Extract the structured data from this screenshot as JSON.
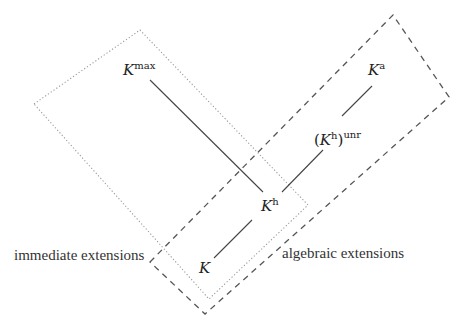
{
  "diagram": {
    "type": "field-extension-lattice",
    "nodes": {
      "K": {
        "base": "K",
        "sup": ""
      },
      "Kh": {
        "base": "K",
        "sup": "h"
      },
      "Kmax": {
        "base": "K",
        "sup": "max"
      },
      "Ka": {
        "base": "K",
        "sup": "a"
      },
      "Khunr": {
        "open": "(",
        "base": "K",
        "sup": "h",
        "close": ")",
        "outer_sup": "unr"
      }
    },
    "edges": [
      {
        "from": "K",
        "to": "Kh"
      },
      {
        "from": "Kh",
        "to": "Kmax"
      },
      {
        "from": "Kh",
        "to": "Khunr"
      },
      {
        "from": "Khunr",
        "to": "Ka"
      }
    ],
    "regions": [
      {
        "name": "immediate-extensions",
        "label": "immediate extensions",
        "style": "dotted"
      },
      {
        "name": "algebraic-extensions",
        "label": "algebraic extensions",
        "style": "dashed"
      }
    ],
    "colors": {
      "stroke": "#555555",
      "text": "#222222",
      "dotted": "#9a9a9a",
      "dashed": "#555555"
    }
  }
}
